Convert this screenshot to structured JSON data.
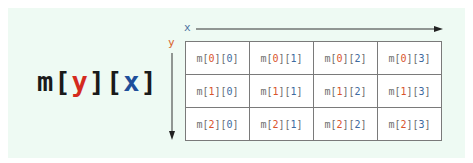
{
  "formula": {
    "prefix": "m[",
    "row_var": "y",
    "mid": "][",
    "col_var": "x",
    "suffix": "]"
  },
  "axes": {
    "x_label": "x",
    "y_label": "y"
  },
  "colors": {
    "background": "#eefaf3",
    "row_var": "#d42a1e",
    "col_var": "#1e4f9a",
    "row_index": "#d9532c",
    "col_index": "#3d6aa0",
    "cell_text": "#6e6e6e",
    "grid_border": "#7a7a7a"
  },
  "grid": {
    "rows": [
      [
        {
          "pre": "m[",
          "r": "0",
          "mid": "][",
          "c": "0",
          "post": "]"
        },
        {
          "pre": "m[",
          "r": "0",
          "mid": "][",
          "c": "1",
          "post": "]"
        },
        {
          "pre": "m[",
          "r": "0",
          "mid": "][",
          "c": "2",
          "post": "]"
        },
        {
          "pre": "m[",
          "r": "0",
          "mid": "][",
          "c": "3",
          "post": "]"
        }
      ],
      [
        {
          "pre": "m[",
          "r": "1",
          "mid": "][",
          "c": "0",
          "post": "]"
        },
        {
          "pre": "m[",
          "r": "1",
          "mid": "][",
          "c": "1",
          "post": "]"
        },
        {
          "pre": "m[",
          "r": "1",
          "mid": "][",
          "c": "2",
          "post": "]"
        },
        {
          "pre": "m[",
          "r": "1",
          "mid": "][",
          "c": "3",
          "post": "]"
        }
      ],
      [
        {
          "pre": "m[",
          "r": "2",
          "mid": "][",
          "c": "0",
          "post": "]"
        },
        {
          "pre": "m[",
          "r": "2",
          "mid": "][",
          "c": "1",
          "post": "]"
        },
        {
          "pre": "m[",
          "r": "2",
          "mid": "][",
          "c": "2",
          "post": "]"
        },
        {
          "pre": "m[",
          "r": "2",
          "mid": "][",
          "c": "3",
          "post": "]"
        }
      ]
    ]
  }
}
